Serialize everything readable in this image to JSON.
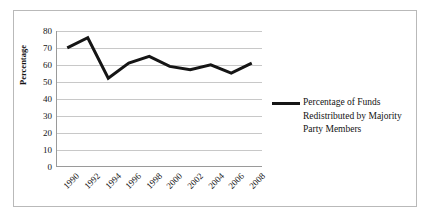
{
  "chart_data": {
    "type": "line",
    "title": "",
    "xlabel": "",
    "ylabel": "Percentage",
    "categories": [
      "1990",
      "1992",
      "1994",
      "1996",
      "1998",
      "2000",
      "2002",
      "2004",
      "2006",
      "2008"
    ],
    "series": [
      {
        "name": "Percentage of Funds Redistributed by Majority Party Members",
        "values": [
          70,
          76,
          52,
          61,
          65,
          59,
          57,
          60,
          55,
          61
        ]
      }
    ],
    "ylim": [
      0,
      80
    ],
    "yticks": [
      0,
      10,
      20,
      30,
      40,
      50,
      60,
      70,
      80
    ],
    "ytick_labels": [
      "0",
      "10",
      "20",
      "30",
      "40",
      "50",
      "60",
      "70",
      "80"
    ],
    "grid": true,
    "grid_axis": "y",
    "legend_position": "right",
    "line_color": "#151515",
    "grid_color": "#c8c8c8",
    "axis_color": "#9a9a9a",
    "frame_color": "#b9b9b9",
    "background": "#ffffff"
  },
  "legend": {
    "entries": [
      {
        "label": "Percentage of Funds Redistributed by Majority Party Members"
      }
    ]
  }
}
